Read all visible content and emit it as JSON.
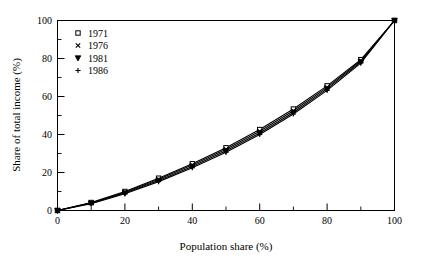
{
  "chart_data": {
    "type": "line",
    "title": "",
    "xlabel": "Population share (%)",
    "ylabel": "Share of total income (%)",
    "xlim": [
      0,
      100
    ],
    "ylim": [
      0,
      100
    ],
    "xticks": [
      0,
      20,
      40,
      60,
      80,
      100
    ],
    "yticks": [
      0,
      20,
      40,
      60,
      80,
      100
    ],
    "xtick_labels": [
      "0",
      "20",
      "40",
      "60",
      "80",
      "100"
    ],
    "ytick_labels": [
      "0",
      "20",
      "40",
      "60",
      "80",
      "100"
    ],
    "minor_xticks": [
      10,
      30,
      50,
      70,
      90
    ],
    "minor_yticks": [
      10,
      30,
      50,
      70,
      90
    ],
    "grid": false,
    "legend_position": "top-left",
    "x": [
      0,
      10,
      20,
      30,
      40,
      50,
      60,
      70,
      80,
      90,
      100
    ],
    "series": [
      {
        "name": "1971",
        "marker": "open-square",
        "values": [
          0,
          4.2,
          10.0,
          17.0,
          24.6,
          33.0,
          42.6,
          53.4,
          65.6,
          79.4,
          100
        ]
      },
      {
        "name": "1976",
        "marker": "cross",
        "values": [
          0,
          4.0,
          9.6,
          16.4,
          23.9,
          32.2,
          41.7,
          52.5,
          64.8,
          78.8,
          100
        ]
      },
      {
        "name": "1981",
        "marker": "triangle-down",
        "values": [
          0,
          3.8,
          9.2,
          15.8,
          23.2,
          31.4,
          40.8,
          51.6,
          64.0,
          78.2,
          100
        ]
      },
      {
        "name": "1986",
        "marker": "plus",
        "values": [
          0,
          3.6,
          8.8,
          15.2,
          22.5,
          30.6,
          40.0,
          50.8,
          63.2,
          77.6,
          100
        ]
      }
    ]
  },
  "legend": {
    "items": [
      {
        "label": "1971",
        "marker": "open-square"
      },
      {
        "label": "1976",
        "marker": "cross"
      },
      {
        "label": "1981",
        "marker": "triangle-down"
      },
      {
        "label": "1986",
        "marker": "plus"
      }
    ]
  },
  "colors": {
    "line": "#000000",
    "frame": "#000000",
    "background": "#ffffff"
  }
}
